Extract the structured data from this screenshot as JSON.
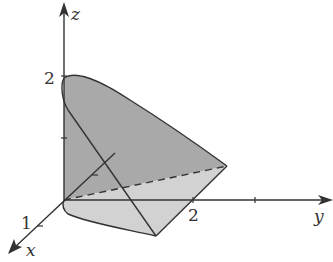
{
  "figure": {
    "type": "3d-solid-region",
    "axes": {
      "x": {
        "label": "x",
        "ticks": [
          {
            "value": "1"
          }
        ]
      },
      "y": {
        "label": "y",
        "ticks": [
          {
            "value": "2"
          },
          {
            "value": ""
          }
        ]
      },
      "z": {
        "label": "z",
        "ticks": [
          {
            "value": "2"
          },
          {
            "value": ""
          }
        ]
      }
    },
    "colors": {
      "back_surface": "#a9a9a9",
      "base_surface": "#d2d2d2",
      "line": "#333333"
    }
  }
}
